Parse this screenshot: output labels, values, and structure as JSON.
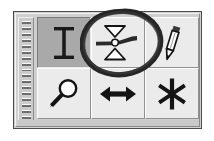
{
  "window": {
    "title": "",
    "type": "floating-tool-palette",
    "frame_color": "#4a4a4a",
    "face_color": "#cfcfcf"
  },
  "drag_grip": {
    "name": "drag-grip",
    "orientation": "vertical",
    "dash_count": 17,
    "dash_color": "#6d6d6d"
  },
  "toolbar": {
    "columns": 3,
    "rows": 2,
    "button_face_color": "#ebebeb",
    "pressed_face_color": "#a9a9a9",
    "buttons": [
      {
        "id": "text-tool",
        "icon": "i-beam-text-icon",
        "label": "Text",
        "tooltip": "Text",
        "state": "pressed",
        "row": 1,
        "column": 1
      },
      {
        "id": "threshold-tool",
        "icon": "threshold-level-icon",
        "label": "Threshold",
        "tooltip": "Threshold",
        "state": "normal",
        "row": 1,
        "column": 2,
        "highlighted": true
      },
      {
        "id": "pencil-tool",
        "icon": "pencil-icon",
        "label": "Pencil",
        "tooltip": "Pencil",
        "state": "normal",
        "row": 1,
        "column": 3
      },
      {
        "id": "zoom-tool",
        "icon": "magnifier-icon",
        "label": "Zoom",
        "tooltip": "Zoom",
        "state": "normal",
        "row": 2,
        "column": 1
      },
      {
        "id": "measure-tool",
        "icon": "double-arrow-horizontal-icon",
        "label": "Measure",
        "tooltip": "Measure",
        "state": "normal",
        "row": 2,
        "column": 2
      },
      {
        "id": "snap-tool",
        "icon": "asterisk-star-icon",
        "label": "Snap",
        "tooltip": "Snap",
        "state": "normal",
        "row": 2,
        "column": 3
      }
    ]
  },
  "annotation": {
    "name": "highlight-ellipse",
    "shape": "hand-drawn-ellipse",
    "stroke_color": "#2b2b2b",
    "targets": "threshold-tool"
  }
}
